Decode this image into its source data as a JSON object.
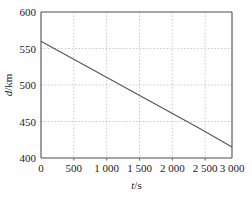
{
  "chart_data": {
    "type": "line",
    "title": "",
    "subtitle": "",
    "xlabel": "t/s",
    "ylabel": "d/km",
    "xlim": [
      0,
      3000
    ],
    "ylim": [
      400,
      600
    ],
    "grid": true,
    "legend": null,
    "legend_position": "none",
    "x_tick_labels": [
      "0",
      "500",
      "1 000",
      "1 500",
      "2 000",
      "2 500",
      "3 000"
    ],
    "x_ticks": [
      0,
      500,
      1000,
      1500,
      2000,
      2500,
      3000
    ],
    "y_tick_labels": [
      "400",
      "450",
      "500",
      "550",
      "600"
    ],
    "y_ticks": [
      400,
      450,
      500,
      550,
      600
    ],
    "x_gridlines": [
      500,
      1000,
      1500,
      2000,
      2500
    ],
    "y_gridlines": [
      450,
      500,
      550
    ],
    "series": [
      {
        "name": "d",
        "x": [
          0,
          500,
          1000,
          1500,
          2000,
          2500,
          3000
        ],
        "values": [
          560,
          536,
          512,
          488,
          464,
          440,
          415
        ],
        "color": "#555555",
        "style": "solid"
      }
    ],
    "annotations": []
  },
  "axis_titles": {
    "x_var": "t",
    "x_unit": "/s",
    "y_var": "d",
    "y_unit": "/km"
  },
  "colors": {
    "axis": "#4d4d4d",
    "grid": "#b0b0b0",
    "line": "#555555",
    "text": "#1a1a1a",
    "background": "#ffffff"
  }
}
